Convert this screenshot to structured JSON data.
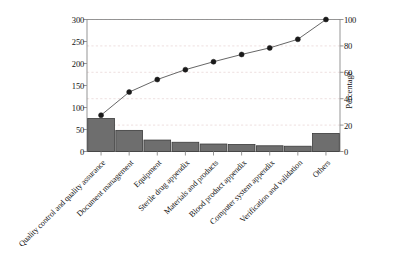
{
  "chart_data": {
    "type": "bar",
    "title": "",
    "subtitle": "",
    "xlabel": "",
    "ylabel": "",
    "ylabel_right": "Percentage",
    "grid": true,
    "legend": false,
    "categories": [
      "Quality control and quality assurance",
      "Document management",
      "Equipment",
      "Sterile drug appendix",
      "Materials and products",
      "Blood product appendix",
      "Computer system appendix",
      "Verification and validation",
      "Others"
    ],
    "values": [
      75,
      48,
      26,
      21,
      17,
      16,
      13,
      12,
      41
    ],
    "cumulative_percentage": [
      27.5,
      45.0,
      54.5,
      62.0,
      68.0,
      73.5,
      78.5,
      85.0,
      100.0
    ],
    "ylim": [
      0,
      300
    ],
    "ylim_right": [
      0,
      100
    ],
    "yticks": [
      0,
      50,
      100,
      150,
      200,
      250,
      300
    ],
    "yticks_right": [
      0,
      20,
      40,
      60,
      80,
      100
    ],
    "bar_color": "#6e6e6e",
    "bar_edge_color": "#3a3a3a",
    "line_color": "#555555",
    "marker_color": "#1a1a1a",
    "grid_color": "#e7d3d3",
    "axis_color": "#8a8a8a"
  },
  "axes": {
    "left_ticks": [
      "300",
      "250",
      "200",
      "150",
      "100",
      "50",
      "0"
    ],
    "right_ticks": [
      "100",
      "80",
      "60",
      "40",
      "20",
      "0"
    ],
    "right_title": "Percentage"
  }
}
